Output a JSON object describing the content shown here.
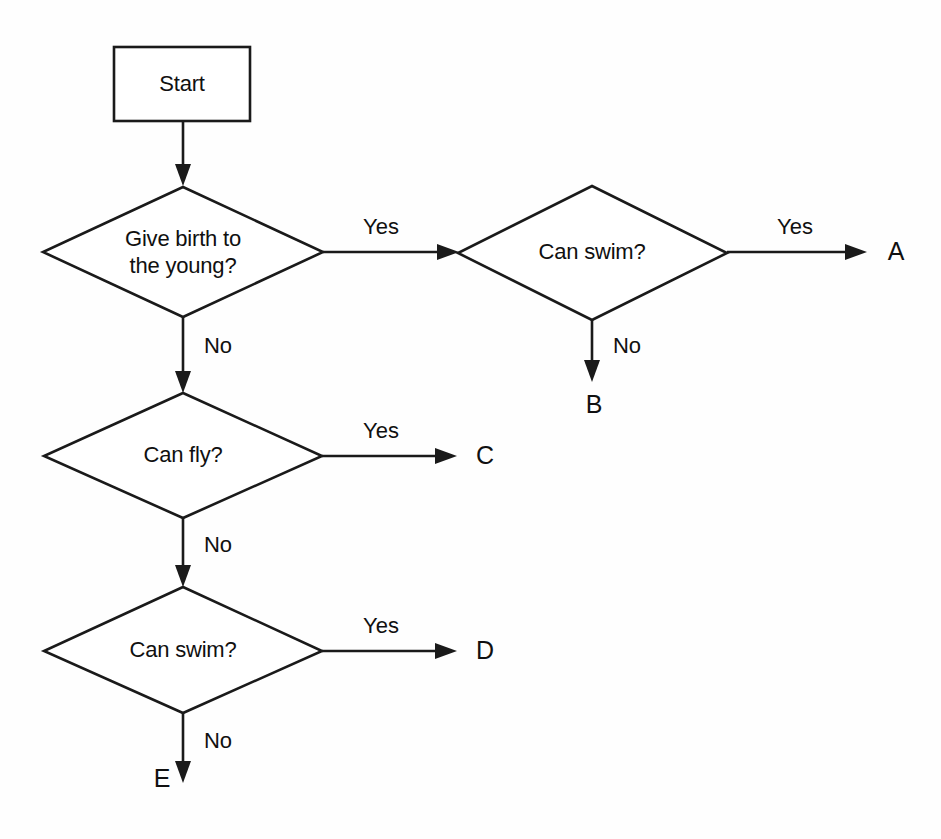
{
  "diagram": {
    "type": "flowchart",
    "background_color": "#fefefe",
    "line_color": "#1a1a1a",
    "text_color": "#101010"
  },
  "nodes": {
    "start": {
      "label": "Start",
      "shape": "rectangle"
    },
    "give_birth": {
      "label_line1": "Give birth to",
      "label_line2": "the young?",
      "shape": "diamond"
    },
    "can_swim_top": {
      "label": "Can swim?",
      "shape": "diamond"
    },
    "can_fly": {
      "label": "Can fly?",
      "shape": "diamond"
    },
    "can_swim_bottom": {
      "label": "Can swim?",
      "shape": "diamond"
    }
  },
  "edge_labels": {
    "give_birth_yes": "Yes",
    "give_birth_no": "No",
    "can_swim_top_yes": "Yes",
    "can_swim_top_no": "No",
    "can_fly_yes": "Yes",
    "can_fly_no": "No",
    "can_swim_bottom_yes": "Yes",
    "can_swim_bottom_no": "No"
  },
  "terminals": {
    "a": "A",
    "b": "B",
    "c": "C",
    "d": "D",
    "e": "E"
  }
}
